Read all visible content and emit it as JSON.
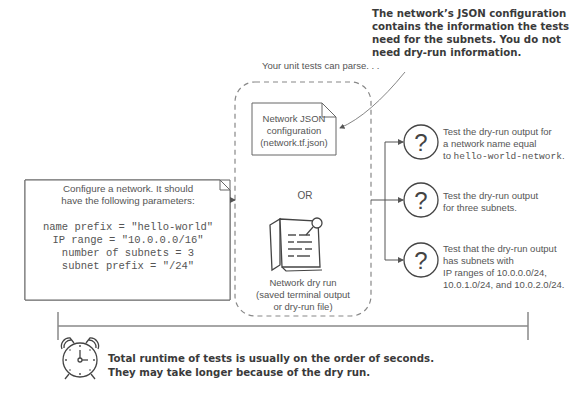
{
  "annotation": {
    "lines": [
      "The network’s JSON configuration",
      "contains the information the tests",
      "need for the subnets. You do not",
      "need dry-run information."
    ]
  },
  "parse_label": "Your unit tests can parse. . .",
  "config_box": {
    "intro_lines": [
      "Configure a network. It should",
      "have the following parameters:"
    ],
    "params": [
      "name prefix = \"hello-world\"",
      "IP range = \"10.0.0.0/16\"",
      "number of subnets = 3",
      "subnet prefix = \"/24\""
    ]
  },
  "json_doc": {
    "lines": [
      "Network JSON",
      "configuration",
      "(network.tf.json)"
    ],
    "icon": "document-icon"
  },
  "or_label": "OR",
  "dry_run": {
    "icon": "pinned-notes-icon",
    "lines": [
      "Network dry run",
      "(saved terminal output",
      "or dry-run file)"
    ]
  },
  "tests": [
    {
      "icon": "question-icon",
      "line1": "Test the dry-run output for",
      "line2": "a network name equal",
      "line3_prefix": "to ",
      "line3_code": "hello-world-network",
      "line3_suffix": "."
    },
    {
      "icon": "question-icon",
      "line1": "Test the dry-run output",
      "line2": "for three subnets."
    },
    {
      "icon": "question-icon",
      "line1": "Test that the dry-run output",
      "line2": "has subnets with",
      "line3": "IP ranges of 10.0.0.0/24,",
      "line4": "10.0.1.0/24, and 10.0.2.0/24."
    }
  ],
  "footer": {
    "icon": "alarm-clock-icon",
    "lines": [
      "Total runtime of tests is usually on the order of seconds.",
      "They may take longer because of the dry run."
    ]
  },
  "colors": {
    "line": "#555555",
    "text": "#444444",
    "timeline": "#888888"
  }
}
